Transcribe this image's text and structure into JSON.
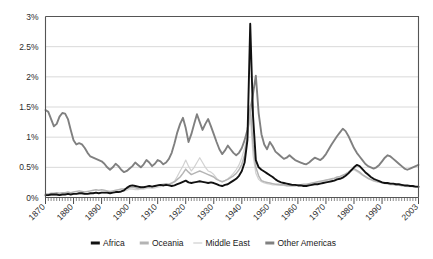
{
  "chart_data": {
    "type": "line",
    "title": "",
    "subtitle": "",
    "xlabel": "",
    "ylabel": "",
    "xlim": [
      1870,
      2003
    ],
    "ylim": [
      0,
      3
    ],
    "grid": true,
    "legend_position": "bottom",
    "y_ticks": [
      0,
      0.5,
      1,
      1.5,
      2,
      2.5,
      3
    ],
    "y_tick_labels": [
      "0%",
      "0.5%",
      "1%",
      "1.5%",
      "2%",
      "2.5%",
      "3%"
    ],
    "x_ticks": [
      1870,
      1880,
      1890,
      1900,
      1910,
      1920,
      1930,
      1940,
      1950,
      1960,
      1970,
      1980,
      1990,
      2003
    ],
    "x_tick_labels": [
      "1870",
      "1880",
      "1890",
      "1900",
      "1910",
      "1920",
      "1930",
      "1940",
      "1950",
      "1960",
      "1970",
      "1980",
      "1990",
      "2003"
    ],
    "x_minor_step": 1,
    "series": [
      {
        "name": "Africa",
        "color": "#111111",
        "width": 1.9,
        "x": [
          1870,
          1871,
          1872,
          1873,
          1874,
          1875,
          1876,
          1877,
          1878,
          1879,
          1880,
          1881,
          1882,
          1883,
          1884,
          1885,
          1886,
          1887,
          1888,
          1889,
          1890,
          1891,
          1892,
          1893,
          1894,
          1895,
          1896,
          1897,
          1898,
          1899,
          1900,
          1901,
          1902,
          1903,
          1904,
          1905,
          1906,
          1907,
          1908,
          1909,
          1910,
          1911,
          1912,
          1913,
          1914,
          1915,
          1916,
          1917,
          1918,
          1919,
          1920,
          1921,
          1922,
          1923,
          1924,
          1925,
          1926,
          1927,
          1928,
          1929,
          1930,
          1931,
          1932,
          1933,
          1934,
          1935,
          1936,
          1937,
          1938,
          1939,
          1940,
          1941,
          1942,
          1943,
          1944,
          1945,
          1946,
          1947,
          1948,
          1949,
          1950,
          1951,
          1952,
          1953,
          1954,
          1955,
          1956,
          1957,
          1958,
          1959,
          1960,
          1961,
          1962,
          1963,
          1964,
          1965,
          1966,
          1967,
          1968,
          1969,
          1970,
          1971,
          1972,
          1973,
          1974,
          1975,
          1976,
          1977,
          1978,
          1979,
          1980,
          1981,
          1982,
          1983,
          1984,
          1985,
          1986,
          1987,
          1988,
          1989,
          1990,
          1991,
          1992,
          1993,
          1994,
          1995,
          1996,
          1997,
          1998,
          1999,
          2000,
          2001,
          2002,
          2003
        ],
        "values": [
          0.04,
          0.04,
          0.05,
          0.05,
          0.05,
          0.04,
          0.05,
          0.05,
          0.06,
          0.05,
          0.06,
          0.06,
          0.07,
          0.07,
          0.06,
          0.06,
          0.07,
          0.07,
          0.08,
          0.07,
          0.08,
          0.08,
          0.08,
          0.07,
          0.08,
          0.09,
          0.09,
          0.1,
          0.12,
          0.16,
          0.19,
          0.2,
          0.19,
          0.18,
          0.17,
          0.17,
          0.18,
          0.19,
          0.18,
          0.19,
          0.2,
          0.21,
          0.2,
          0.21,
          0.2,
          0.19,
          0.2,
          0.22,
          0.24,
          0.26,
          0.28,
          0.25,
          0.24,
          0.25,
          0.26,
          0.27,
          0.26,
          0.25,
          0.24,
          0.25,
          0.24,
          0.22,
          0.2,
          0.19,
          0.21,
          0.22,
          0.25,
          0.28,
          0.31,
          0.36,
          0.44,
          0.58,
          0.95,
          2.88,
          1.35,
          0.62,
          0.5,
          0.46,
          0.43,
          0.4,
          0.37,
          0.34,
          0.3,
          0.27,
          0.25,
          0.24,
          0.23,
          0.22,
          0.21,
          0.21,
          0.2,
          0.2,
          0.19,
          0.19,
          0.2,
          0.21,
          0.22,
          0.22,
          0.23,
          0.24,
          0.25,
          0.26,
          0.27,
          0.28,
          0.3,
          0.31,
          0.33,
          0.36,
          0.4,
          0.45,
          0.5,
          0.54,
          0.52,
          0.47,
          0.42,
          0.38,
          0.34,
          0.31,
          0.29,
          0.27,
          0.25,
          0.24,
          0.24,
          0.23,
          0.23,
          0.22,
          0.22,
          0.21,
          0.2,
          0.2,
          0.19,
          0.19,
          0.18,
          0.18
        ]
      },
      {
        "name": "Oceania",
        "color": "#b4b4b4",
        "width": 1.5,
        "x": [
          1870,
          1871,
          1872,
          1873,
          1874,
          1875,
          1876,
          1877,
          1878,
          1879,
          1880,
          1881,
          1882,
          1883,
          1884,
          1885,
          1886,
          1887,
          1888,
          1889,
          1890,
          1891,
          1892,
          1893,
          1894,
          1895,
          1896,
          1897,
          1898,
          1899,
          1900,
          1901,
          1902,
          1903,
          1904,
          1905,
          1906,
          1907,
          1908,
          1909,
          1910,
          1911,
          1912,
          1913,
          1914,
          1915,
          1916,
          1917,
          1918,
          1919,
          1920,
          1921,
          1922,
          1923,
          1924,
          1925,
          1926,
          1927,
          1928,
          1929,
          1930,
          1931,
          1932,
          1933,
          1934,
          1935,
          1936,
          1937,
          1938,
          1939,
          1940,
          1941,
          1942,
          1943,
          1944,
          1945,
          1946,
          1947,
          1948,
          1949,
          1950,
          1951,
          1952,
          1953,
          1954,
          1955,
          1956,
          1957,
          1958,
          1959,
          1960,
          1961,
          1962,
          1963,
          1964,
          1965,
          1966,
          1967,
          1968,
          1969,
          1970,
          1971,
          1972,
          1973,
          1974,
          1975,
          1976,
          1977,
          1978,
          1979,
          1980,
          1981,
          1982,
          1983,
          1984,
          1985,
          1986,
          1987,
          1988,
          1989,
          1990,
          1991,
          1992,
          1993,
          1994,
          1995,
          1996,
          1997,
          1998,
          1999,
          2000,
          2001,
          2002,
          2003
        ],
        "values": [
          0.06,
          0.06,
          0.07,
          0.07,
          0.08,
          0.07,
          0.08,
          0.08,
          0.09,
          0.08,
          0.09,
          0.1,
          0.11,
          0.1,
          0.09,
          0.1,
          0.11,
          0.12,
          0.13,
          0.12,
          0.13,
          0.12,
          0.11,
          0.1,
          0.11,
          0.12,
          0.13,
          0.14,
          0.14,
          0.15,
          0.16,
          0.17,
          0.16,
          0.15,
          0.16,
          0.17,
          0.18,
          0.19,
          0.18,
          0.19,
          0.2,
          0.21,
          0.22,
          0.23,
          0.22,
          0.24,
          0.26,
          0.3,
          0.34,
          0.4,
          0.47,
          0.42,
          0.38,
          0.4,
          0.42,
          0.44,
          0.42,
          0.4,
          0.38,
          0.36,
          0.34,
          0.3,
          0.28,
          0.26,
          0.28,
          0.3,
          0.33,
          0.36,
          0.4,
          0.46,
          0.55,
          0.7,
          1.0,
          1.52,
          0.88,
          0.5,
          0.36,
          0.28,
          0.26,
          0.25,
          0.24,
          0.23,
          0.22,
          0.22,
          0.21,
          0.21,
          0.2,
          0.2,
          0.2,
          0.2,
          0.21,
          0.21,
          0.22,
          0.22,
          0.23,
          0.24,
          0.25,
          0.26,
          0.27,
          0.28,
          0.29,
          0.3,
          0.31,
          0.32,
          0.34,
          0.35,
          0.37,
          0.39,
          0.42,
          0.46,
          0.48,
          0.45,
          0.42,
          0.38,
          0.35,
          0.32,
          0.3,
          0.28,
          0.27,
          0.26,
          0.25,
          0.24,
          0.23,
          0.22,
          0.22,
          0.21,
          0.21,
          0.2,
          0.2,
          0.19,
          0.19,
          0.18,
          0.18,
          0.17
        ]
      },
      {
        "name": "Middle East",
        "color": "#d2d2d2",
        "width": 1.2,
        "x": [
          1870,
          1871,
          1872,
          1873,
          1874,
          1875,
          1876,
          1877,
          1878,
          1879,
          1880,
          1881,
          1882,
          1883,
          1884,
          1885,
          1886,
          1887,
          1888,
          1889,
          1890,
          1891,
          1892,
          1893,
          1894,
          1895,
          1896,
          1897,
          1898,
          1899,
          1900,
          1901,
          1902,
          1903,
          1904,
          1905,
          1906,
          1907,
          1908,
          1909,
          1910,
          1911,
          1912,
          1913,
          1914,
          1915,
          1916,
          1917,
          1918,
          1919,
          1920,
          1921,
          1922,
          1923,
          1924,
          1925,
          1926,
          1927,
          1928,
          1929,
          1930,
          1931,
          1932,
          1933,
          1934,
          1935,
          1936,
          1937,
          1938,
          1939,
          1940,
          1941,
          1942,
          1943,
          1944,
          1945,
          1946,
          1947,
          1948,
          1949,
          1950,
          1951,
          1952,
          1953,
          1954,
          1955,
          1956,
          1957,
          1958,
          1959,
          1960,
          1961,
          1962,
          1963,
          1964,
          1965,
          1966,
          1967,
          1968,
          1969,
          1970,
          1971,
          1972,
          1973,
          1974,
          1975,
          1976,
          1977,
          1978,
          1979,
          1980,
          1981,
          1982,
          1983,
          1984,
          1985,
          1986,
          1987,
          1988,
          1989,
          1990,
          1991,
          1992,
          1993,
          1994,
          1995,
          1996,
          1997,
          1998,
          1999,
          2000,
          2001,
          2002,
          2003
        ],
        "values": [
          0.03,
          0.03,
          0.04,
          0.04,
          0.04,
          0.04,
          0.05,
          0.05,
          0.05,
          0.05,
          0.06,
          0.06,
          0.06,
          0.06,
          0.05,
          0.06,
          0.06,
          0.07,
          0.07,
          0.07,
          0.08,
          0.07,
          0.07,
          0.07,
          0.08,
          0.08,
          0.09,
          0.1,
          0.11,
          0.12,
          0.14,
          0.14,
          0.13,
          0.13,
          0.14,
          0.14,
          0.15,
          0.16,
          0.15,
          0.16,
          0.17,
          0.18,
          0.19,
          0.2,
          0.21,
          0.23,
          0.27,
          0.35,
          0.44,
          0.52,
          0.62,
          0.52,
          0.44,
          0.5,
          0.58,
          0.66,
          0.58,
          0.5,
          0.44,
          0.42,
          0.38,
          0.32,
          0.28,
          0.26,
          0.28,
          0.31,
          0.35,
          0.4,
          0.46,
          0.54,
          0.66,
          0.82,
          1.05,
          1.35,
          0.7,
          0.4,
          0.3,
          0.26,
          0.24,
          0.23,
          0.22,
          0.21,
          0.21,
          0.2,
          0.2,
          0.2,
          0.19,
          0.19,
          0.19,
          0.19,
          0.2,
          0.2,
          0.21,
          0.21,
          0.22,
          0.23,
          0.24,
          0.25,
          0.26,
          0.27,
          0.28,
          0.29,
          0.3,
          0.31,
          0.32,
          0.34,
          0.36,
          0.38,
          0.41,
          0.44,
          0.46,
          0.43,
          0.4,
          0.37,
          0.34,
          0.31,
          0.29,
          0.27,
          0.26,
          0.25,
          0.24,
          0.23,
          0.22,
          0.21,
          0.21,
          0.2,
          0.2,
          0.19,
          0.19,
          0.18,
          0.18,
          0.18,
          0.17,
          0.17
        ]
      },
      {
        "name": "Other Americas",
        "color": "#808080",
        "width": 1.9,
        "x": [
          1870,
          1871,
          1872,
          1873,
          1874,
          1875,
          1876,
          1877,
          1878,
          1879,
          1880,
          1881,
          1882,
          1883,
          1884,
          1885,
          1886,
          1887,
          1888,
          1889,
          1890,
          1891,
          1892,
          1893,
          1894,
          1895,
          1896,
          1897,
          1898,
          1899,
          1900,
          1901,
          1902,
          1903,
          1904,
          1905,
          1906,
          1907,
          1908,
          1909,
          1910,
          1911,
          1912,
          1913,
          1914,
          1915,
          1916,
          1917,
          1918,
          1919,
          1920,
          1921,
          1922,
          1923,
          1924,
          1925,
          1926,
          1927,
          1928,
          1929,
          1930,
          1931,
          1932,
          1933,
          1934,
          1935,
          1936,
          1937,
          1938,
          1939,
          1940,
          1941,
          1942,
          1943,
          1944,
          1945,
          1946,
          1947,
          1948,
          1949,
          1950,
          1951,
          1952,
          1953,
          1954,
          1955,
          1956,
          1957,
          1958,
          1959,
          1960,
          1961,
          1962,
          1963,
          1964,
          1965,
          1966,
          1967,
          1968,
          1969,
          1970,
          1971,
          1972,
          1973,
          1974,
          1975,
          1976,
          1977,
          1978,
          1979,
          1980,
          1981,
          1982,
          1983,
          1984,
          1985,
          1986,
          1987,
          1988,
          1989,
          1990,
          1991,
          1992,
          1993,
          1994,
          1995,
          1996,
          1997,
          1998,
          1999,
          2000,
          2001,
          2002,
          2003
        ],
        "values": [
          1.45,
          1.42,
          1.3,
          1.18,
          1.22,
          1.34,
          1.4,
          1.39,
          1.3,
          1.12,
          0.95,
          0.88,
          0.9,
          0.88,
          0.82,
          0.74,
          0.68,
          0.66,
          0.64,
          0.62,
          0.6,
          0.56,
          0.5,
          0.46,
          0.5,
          0.56,
          0.52,
          0.46,
          0.42,
          0.44,
          0.48,
          0.52,
          0.58,
          0.54,
          0.5,
          0.55,
          0.62,
          0.58,
          0.52,
          0.56,
          0.62,
          0.6,
          0.55,
          0.58,
          0.64,
          0.74,
          0.9,
          1.08,
          1.22,
          1.32,
          1.15,
          0.92,
          1.05,
          1.22,
          1.38,
          1.25,
          1.12,
          1.22,
          1.3,
          1.18,
          1.05,
          0.92,
          0.8,
          0.72,
          0.78,
          0.86,
          0.8,
          0.74,
          0.7,
          0.74,
          0.82,
          0.95,
          1.12,
          1.42,
          1.72,
          2.02,
          1.4,
          1.05,
          0.88,
          0.8,
          0.92,
          0.85,
          0.76,
          0.72,
          0.68,
          0.64,
          0.66,
          0.7,
          0.66,
          0.62,
          0.6,
          0.58,
          0.56,
          0.55,
          0.58,
          0.62,
          0.66,
          0.64,
          0.62,
          0.66,
          0.72,
          0.8,
          0.88,
          0.95,
          1.02,
          1.08,
          1.14,
          1.1,
          1.02,
          0.92,
          0.82,
          0.74,
          0.68,
          0.62,
          0.56,
          0.52,
          0.5,
          0.48,
          0.5,
          0.54,
          0.6,
          0.66,
          0.7,
          0.68,
          0.64,
          0.6,
          0.56,
          0.52,
          0.48,
          0.46,
          0.48,
          0.5,
          0.52,
          0.54
        ]
      }
    ]
  },
  "legend": {
    "items": [
      {
        "label": "Africa",
        "color": "#111111"
      },
      {
        "label": "Oceania",
        "color": "#b4b4b4"
      },
      {
        "label": "Middle East",
        "color": "#d2d2d2"
      },
      {
        "label": "Other Americas",
        "color": "#808080"
      }
    ]
  }
}
